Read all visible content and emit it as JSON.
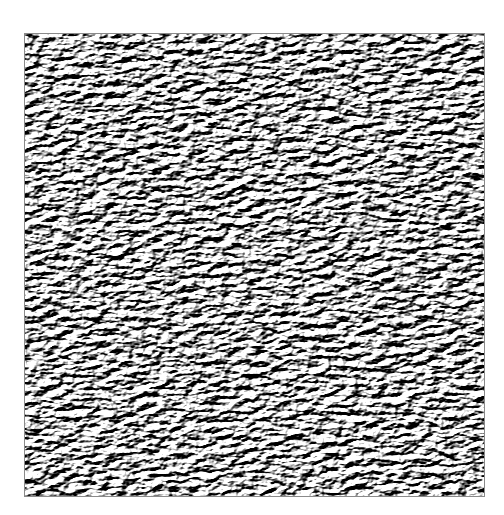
{
  "image": {
    "description": "Grayscale embossed noise texture inside a thin gray-bordered square on a white background",
    "colors": {
      "background": "#ffffff",
      "border": "#8a8a8a",
      "texture_dark": "#3a3a3a",
      "texture_mid": "#9a9a9a",
      "texture_light": "#f4f4f4"
    }
  }
}
